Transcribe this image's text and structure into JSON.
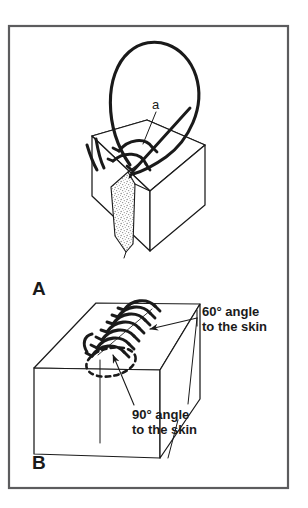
{
  "figure": {
    "border_color": "#59595b",
    "ink_color": "#1a1a1a",
    "background": "#ffffff",
    "stipple_color": "#8a8a8a"
  },
  "panels": [
    {
      "id": "A",
      "letter": "A",
      "description": "Cross-section of skin block with V-shaped wound and suture loop being placed",
      "annotations": [
        {
          "id": "a",
          "label": "a",
          "description": "suture loop entry point marker"
        }
      ]
    },
    {
      "id": "B",
      "letter": "B",
      "description": "Skin block with completed running suture line showing needle entry angles",
      "annotations": [
        {
          "id": "angle60",
          "label": "60° angle",
          "label_line2": "to the skin"
        },
        {
          "id": "angle90",
          "label": "90° angle",
          "label_line2": "to the skin"
        }
      ]
    }
  ],
  "callouts": {
    "angle_60_line1": "60° angle",
    "angle_60_line2": "to the skin",
    "angle_90_line1": "90° angle",
    "angle_90_line2": "to the skin",
    "point_a": "a"
  },
  "panel_letters": {
    "a_label": "A",
    "b_label": "B"
  }
}
